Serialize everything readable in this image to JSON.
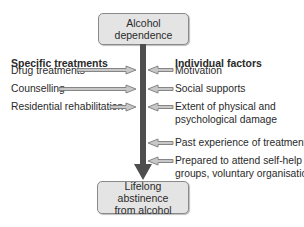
{
  "top_box": {
    "label": "Alcohol dependence"
  },
  "bottom_box": {
    "line1": "Lifelong abstinence",
    "line2": "from alcohol"
  },
  "left": {
    "heading": "Specific treatments",
    "items": [
      {
        "label": "Drug treatments"
      },
      {
        "label": "Counselling"
      },
      {
        "label": "Residential rehabilitation"
      }
    ]
  },
  "right": {
    "heading": "Individual factors",
    "items": [
      {
        "line1": "Motivation",
        "line2": ""
      },
      {
        "line1": "Social supports",
        "line2": ""
      },
      {
        "line1": "Extent of physical and",
        "line2": "psychological damage"
      },
      {
        "line1": "Past experience of treatment",
        "line2": ""
      },
      {
        "line1": "Prepared to attend self-help",
        "line2": "groups, voluntary organisations"
      }
    ]
  },
  "colors": {
    "box_fill": "#e4e4e4",
    "main_arrow": "#4e4e4e",
    "side_arrow_fill": "#c8c8c8",
    "side_arrow_stroke": "#7a7a7a"
  }
}
